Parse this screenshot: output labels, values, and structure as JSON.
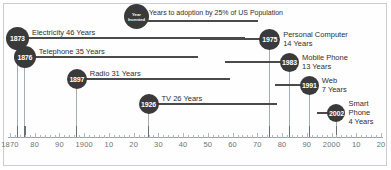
{
  "chart_data": {
    "type": "bar",
    "title": "",
    "xlabel": "",
    "ylabel": "",
    "xlim": [
      1870,
      2020
    ],
    "grid": false,
    "orientation": "horizontal-timeline",
    "legend": {
      "circle_line1": "Year",
      "circle_line2": "Invented",
      "bar_text": "Years to adoption by 25% of US Population"
    },
    "axis": {
      "ticks": [
        {
          "value": 1870,
          "label": "1870",
          "major": true
        },
        {
          "value": 1880,
          "label": "80",
          "major": true
        },
        {
          "value": 1890,
          "label": "90",
          "major": true
        },
        {
          "value": 1900,
          "label": "1900",
          "major": true
        },
        {
          "value": 1910,
          "label": "10",
          "major": true
        },
        {
          "value": 1920,
          "label": "20",
          "major": true
        },
        {
          "value": 1930,
          "label": "30",
          "major": true
        },
        {
          "value": 1940,
          "label": "40",
          "major": true
        },
        {
          "value": 1950,
          "label": "50",
          "major": true
        },
        {
          "value": 1960,
          "label": "60",
          "major": true
        },
        {
          "value": 1970,
          "label": "70",
          "major": true
        },
        {
          "value": 1980,
          "label": "80",
          "major": true
        },
        {
          "value": 1990,
          "label": "90",
          "major": true
        },
        {
          "value": 2000,
          "label": "2000",
          "major": true
        },
        {
          "value": 2010,
          "label": "10",
          "major": true
        },
        {
          "value": 2020,
          "label": "20",
          "major": true
        }
      ]
    },
    "categories": [
      "Electricity",
      "Telephone",
      "Radio",
      "TV",
      "Personal Computer",
      "Mobile Phone",
      "Web",
      "Smart Phone"
    ],
    "values": [
      46,
      35,
      31,
      26,
      14,
      13,
      7,
      4
    ],
    "x": [
      1873,
      1876,
      1897,
      1926,
      1975,
      1983,
      1991,
      2002
    ],
    "events": [
      {
        "year": "1873",
        "year_value": 1873,
        "name": "Electricity",
        "years_label": "46 Years",
        "years_value": 46,
        "label_text": "Electricity 46 Years"
      },
      {
        "year": "1876",
        "year_value": 1876,
        "name": "Telephone",
        "years_label": "35 Years",
        "years_value": 35,
        "label_text": "Telephone 35 Years"
      },
      {
        "year": "1897",
        "year_value": 1897,
        "name": "Radio",
        "years_label": "31 Years",
        "years_value": 31,
        "label_text": "Radio 31 Years"
      },
      {
        "year": "1926",
        "year_value": 1926,
        "name": "TV",
        "years_label": "26 Years",
        "years_value": 26,
        "label_text": "TV 26 Years"
      },
      {
        "year": "1975",
        "year_value": 1975,
        "name": "Personal Computer",
        "years_label": "14 Years",
        "years_value": 14,
        "label_line1": "Personal Computer",
        "label_line2": "14 Years"
      },
      {
        "year": "1983",
        "year_value": 1983,
        "name": "Mobile Phone",
        "years_label": "13 Years",
        "years_value": 13,
        "label_line1": "Mobile Phone",
        "label_line2": "13 Years"
      },
      {
        "year": "1991",
        "year_value": 1991,
        "name": "Web",
        "years_label": "7 Years",
        "years_value": 7,
        "label_line1": "Web",
        "label_line2": "7 Years"
      },
      {
        "year": "2002",
        "year_value": 2002,
        "name": "Smart Phone",
        "years_label": "4 Years",
        "years_value": 4,
        "label_line1": "Smart",
        "label_line2": "Phone",
        "label_line3": "4 Years"
      }
    ],
    "colors": {
      "circle_fill": "#3a3a3a",
      "circle_text": "#ffffff",
      "bar": "#4a4a4a",
      "axis": "#9aa0a6",
      "label_text": "#2e2e2e",
      "tick_label": "#6d7278",
      "background": "#ffffff",
      "border": "#c9ccd1"
    }
  }
}
